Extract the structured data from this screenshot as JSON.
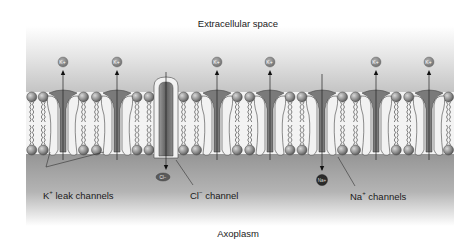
{
  "diagram": {
    "regions": {
      "top_label": "Extracellular space",
      "bottom_label": "Axoplasm"
    },
    "ions": {
      "potassium": "K",
      "potassium_charge": "+",
      "chloride": "Cl",
      "chloride_charge": "−",
      "sodium": "Na",
      "sodium_charge": "+"
    },
    "labels": {
      "k_leak": {
        "ion": "K",
        "charge": "+",
        "text": " leak channels"
      },
      "cl_channel": {
        "ion": "Cl",
        "charge": "−",
        "text": " channel"
      },
      "na_channels": {
        "ion": "Na",
        "charge": "+",
        "text": " channels"
      }
    },
    "channels": [
      {
        "type": "K+ leak",
        "x": 63,
        "flow": "out"
      },
      {
        "type": "K+ leak",
        "x": 117,
        "flow": "out"
      },
      {
        "type": "Cl-",
        "x": 166,
        "flow": "in"
      },
      {
        "type": "K+ leak",
        "x": 217,
        "flow": "out"
      },
      {
        "type": "K+ leak",
        "x": 270,
        "flow": "out"
      },
      {
        "type": "Na+",
        "x": 322,
        "flow": "in"
      },
      {
        "type": "K+ leak",
        "x": 376,
        "flow": "out"
      },
      {
        "type": "K+ leak",
        "x": 429,
        "flow": "out"
      }
    ],
    "colors": {
      "extracellular_top": "#ffffff",
      "extracellular_mid": "#c8c8c8",
      "axoplasm": "#9a9a9a",
      "membrane_core": "#f4f4f4",
      "head": "#8c8c8c",
      "channel_protein": "#f2f2f2",
      "pore": "#6e6e6e",
      "na_ion": "#2a2a2a",
      "k_ion": "#8a8a8a",
      "cl_ion": "#5a5a5a"
    }
  }
}
